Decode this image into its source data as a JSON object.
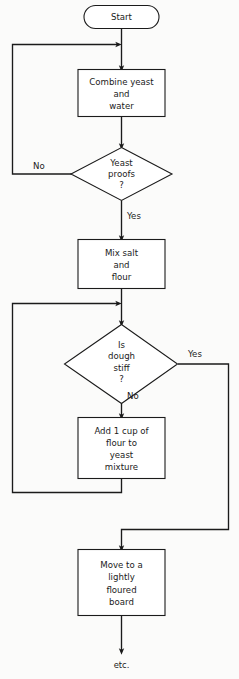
{
  "document": {
    "kind": "flowchart",
    "subject": "Bread dough preparation procedure",
    "background_color": "#fbfbfa",
    "line_color": "#1b1b1b",
    "node_fill": "#ffffff"
  },
  "nodes": {
    "start": {
      "id": "start",
      "shape": "terminator",
      "label": "Start",
      "lines": [
        "Start"
      ]
    },
    "combine": {
      "id": "combine",
      "shape": "process",
      "label": "Combine yeast and water",
      "lines": [
        "Combine yeast",
        "and",
        "water"
      ]
    },
    "yeast_proofs": {
      "id": "yeast_proofs",
      "shape": "decision",
      "label": "Yeast proofs ?",
      "lines": [
        "Yeast",
        "proofs",
        "?"
      ]
    },
    "mix": {
      "id": "mix",
      "shape": "process",
      "label": "Mix salt and flour",
      "lines": [
        "Mix salt",
        "and",
        "flour"
      ]
    },
    "dough_stiff": {
      "id": "dough_stiff",
      "shape": "decision",
      "label": "Is dough stiff ?",
      "lines": [
        "Is",
        "dough",
        "stiff",
        "?"
      ]
    },
    "add_flour": {
      "id": "add_flour",
      "shape": "process",
      "label": "Add 1 cup of flour to yeast mixture",
      "lines": [
        "Add 1 cup of",
        "flour to",
        "yeast",
        "mixture"
      ]
    },
    "move_board": {
      "id": "move_board",
      "shape": "process",
      "label": "Move to a lightly floured board",
      "lines": [
        "Move to a",
        "lightly",
        "floured",
        "board"
      ]
    },
    "etc": {
      "id": "etc",
      "shape": "note",
      "label": "etc.",
      "lines": [
        "etc."
      ]
    }
  },
  "edge_labels": {
    "yeast_no": "No",
    "yeast_yes": "Yes",
    "dough_yes": "Yes",
    "dough_no": "No"
  },
  "edges": [
    {
      "from": "start",
      "to": "combine",
      "label": ""
    },
    {
      "from": "combine",
      "to": "yeast_proofs",
      "label": ""
    },
    {
      "from": "yeast_proofs",
      "to": "combine",
      "label": "No"
    },
    {
      "from": "yeast_proofs",
      "to": "mix",
      "label": "Yes"
    },
    {
      "from": "mix",
      "to": "dough_stiff",
      "label": ""
    },
    {
      "from": "dough_stiff",
      "to": "move_board",
      "label": "Yes"
    },
    {
      "from": "dough_stiff",
      "to": "add_flour",
      "label": "No"
    },
    {
      "from": "add_flour",
      "to": "dough_stiff",
      "label": ""
    },
    {
      "from": "move_board",
      "to": "etc",
      "label": ""
    }
  ]
}
